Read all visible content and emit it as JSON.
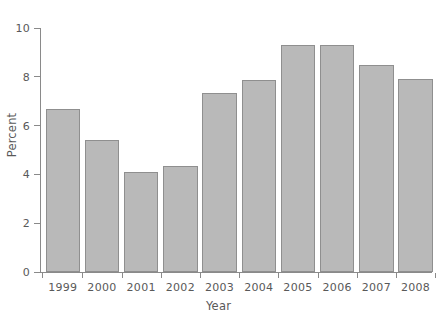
{
  "chart_data": {
    "type": "bar",
    "title": "",
    "xlabel": "Year",
    "ylabel": "Percent",
    "categories": [
      "1999",
      "2000",
      "2001",
      "2002",
      "2003",
      "2004",
      "2005",
      "2006",
      "2007",
      "2008"
    ],
    "values": [
      6.7,
      5.4,
      4.1,
      4.35,
      7.35,
      7.85,
      9.3,
      9.3,
      8.5,
      7.9
    ],
    "ylim": [
      0,
      10
    ],
    "yticks": [
      0,
      2,
      4,
      6,
      8,
      10
    ],
    "ytick_labels": [
      "0",
      "2",
      "4",
      "6",
      "8",
      "10"
    ],
    "grid": false,
    "legend": null,
    "bar_color": "#b9b9b9",
    "bar_border_color": "#8f8f8f",
    "axis_color": "#8a8a8a",
    "text_color": "#595959"
  },
  "axes": {
    "y_title": "Percent",
    "x_title": "Year"
  },
  "title_remnant": ""
}
